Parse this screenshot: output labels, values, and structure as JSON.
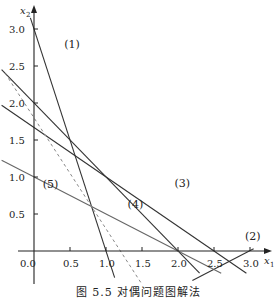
{
  "chart_data": {
    "type": "line",
    "title": "",
    "caption": "图 5.5  对偶问题图解法",
    "xlabel": "x1",
    "ylabel": "x2",
    "xlim": [
      -0.45,
      3.15
    ],
    "ylim": [
      -0.55,
      3.2
    ],
    "grid": false,
    "x_ticks": [
      0.0,
      0.5,
      1.0,
      1.5,
      2.0,
      2.5,
      3.0
    ],
    "x_tick_labels": [
      "0.0",
      "0.5",
      "1.0",
      "1.5",
      "2.0",
      "2.5",
      "3.0"
    ],
    "y_ticks": [
      0.5,
      1.0,
      1.5,
      2.0,
      2.5,
      3.0
    ],
    "y_tick_labels": [
      "0.5",
      "1.0",
      "1.5",
      "2.0",
      "2.5",
      "3.0"
    ],
    "series": [
      {
        "name": "(1)",
        "equation": "3x1 + x2 = 3",
        "style": "solid",
        "color": "#333333",
        "points": [
          [
            -0.05,
            3.15
          ],
          [
            1.12,
            -0.36
          ]
        ],
        "label_pos": [
          0.42,
          2.75
        ]
      },
      {
        "name": "(2)",
        "equation": "x1 - 2x2 = 3",
        "style": "solid",
        "color": "#333333",
        "points": [
          [
            2.2,
            -0.4
          ],
          [
            3.05,
            0.03
          ]
        ],
        "label_pos": [
          2.93,
          0.15
        ]
      },
      {
        "name": "(3)",
        "equation": "x1 + x2 = 2",
        "style": "solid",
        "color": "#333333",
        "points": [
          [
            -0.45,
            2.45
          ],
          [
            2.3,
            -0.3
          ]
        ],
        "label_pos": [
          1.95,
          0.87
        ]
      },
      {
        "name": "",
        "equation": "2x1 + 3x2 = 5",
        "style": "solid",
        "color": "#333333",
        "points": [
          [
            -0.45,
            1.97
          ],
          [
            2.95,
            -0.3
          ]
        ],
        "label_pos": null
      },
      {
        "name": "(4)",
        "equation": "x1 + 2x2 = 2",
        "style": "solid",
        "color": "#666666",
        "points": [
          [
            -0.45,
            1.225
          ],
          [
            2.6,
            -0.3
          ]
        ],
        "label_pos": [
          1.3,
          0.58
        ]
      },
      {
        "name": "objective",
        "equation": "3x1 + 2x2 = 3.6",
        "style": "dashed",
        "color": "#888888",
        "points": [
          [
            -0.4,
            2.4
          ],
          [
            1.5,
            -0.45
          ]
        ],
        "label_pos": null
      },
      {
        "name": "(5)",
        "equation": "x1 = 0",
        "style": "axis",
        "color": "#333333",
        "points": [],
        "label_pos": [
          0.12,
          0.85
        ]
      }
    ],
    "annotations": [
      "(1)",
      "(2)",
      "(3)",
      "(4)",
      "(5)"
    ]
  }
}
